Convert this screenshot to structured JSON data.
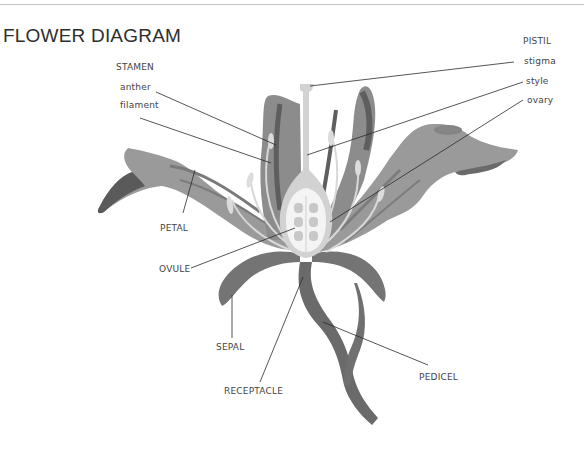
{
  "title": "FLOWER DIAGRAM",
  "labels": {
    "stamen_group": "STAMEN",
    "anther": "anther",
    "filament": "filament",
    "pistil_group": "PISTIL",
    "stigma": "stigma",
    "style": "style",
    "ovary": "ovary",
    "petal": "PETAL",
    "ovule": "OVULE",
    "sepal": "SEPAL",
    "receptacle": "RECEPTACLE",
    "pedicel": "PEDICEL"
  },
  "colors": {
    "background": "#ffffff",
    "petal_light": "#9a9a9a",
    "petal_mid": "#858585",
    "petal_dark": "#5f5f5f",
    "stem": "#6e6e6e",
    "pistil": "#d4d4d4",
    "ovary_core": "#f2f2f2",
    "leader_line": "#2a2a2a"
  }
}
